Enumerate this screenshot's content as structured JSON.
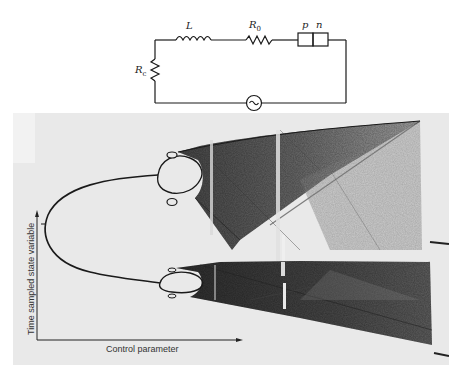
{
  "circuit": {
    "components": [
      {
        "id": "inductor",
        "label": "L"
      },
      {
        "id": "resistor-r0",
        "label_main": "R",
        "label_sub": "0"
      },
      {
        "id": "pn-junction",
        "label_p": "p",
        "label_n": "n"
      },
      {
        "id": "resistor-rc",
        "label_main": "R",
        "label_sub": "c"
      },
      {
        "id": "ac-source",
        "symbol": "~"
      }
    ]
  },
  "bifurcation_figure": {
    "y_axis_label": "Time sampled state variable",
    "x_axis_label": "Control parameter",
    "colors": {
      "background": "#e9e9e9",
      "ink": "#1a1a1a",
      "chaos_dark": "#3a3a3a",
      "chaos_light": "#8a8a8a"
    }
  }
}
